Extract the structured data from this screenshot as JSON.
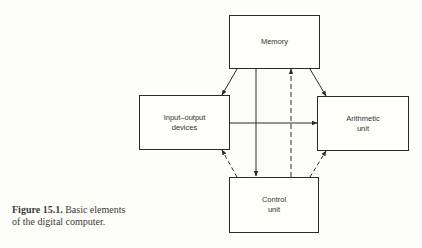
{
  "diagram": {
    "nodes": [
      {
        "id": "memory",
        "label": "Memory"
      },
      {
        "id": "io",
        "label": "Input–output\ndevices"
      },
      {
        "id": "arith",
        "label": "Arithmetic\nunit"
      },
      {
        "id": "control",
        "label": "Control\nunit"
      }
    ],
    "edges": [
      {
        "from": "memory",
        "to": "io",
        "style": "solid",
        "direction": "both"
      },
      {
        "from": "memory",
        "to": "arith",
        "style": "solid",
        "direction": "both"
      },
      {
        "from": "memory",
        "to": "control",
        "style": "solid",
        "direction": "both"
      },
      {
        "from": "control",
        "to": "memory",
        "style": "dashed",
        "direction": "forward"
      },
      {
        "from": "io",
        "to": "arith",
        "style": "solid",
        "direction": "both"
      },
      {
        "from": "control",
        "to": "io",
        "style": "dashed",
        "direction": "forward"
      },
      {
        "from": "control",
        "to": "arith",
        "style": "dashed",
        "direction": "forward"
      }
    ]
  },
  "caption": {
    "label": "Figure 15.1.",
    "text": "Basic elements",
    "text2": "of the digital computer."
  }
}
